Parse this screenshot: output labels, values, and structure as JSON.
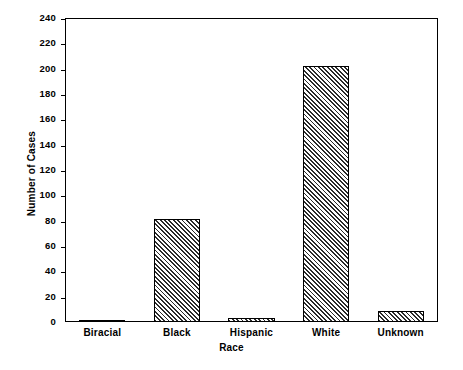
{
  "chart_data": {
    "type": "bar",
    "title": "",
    "subtitle": "",
    "xlabel": "Race",
    "ylabel": "Number of Cases",
    "categories": [
      "Biracial",
      "Black",
      "Hispanic",
      "White",
      "Unknown"
    ],
    "values": [
      1,
      81,
      3,
      202,
      9
    ],
    "series": [
      {
        "name": "Number of Cases",
        "values": [
          1,
          81,
          3,
          202,
          9
        ]
      }
    ],
    "ylim": [
      0,
      240
    ],
    "ytick_step": 20,
    "yticks": [
      0,
      20,
      40,
      60,
      80,
      100,
      120,
      140,
      160,
      180,
      200,
      220,
      240
    ],
    "ytick_labels": [
      "0",
      "20",
      "40",
      "60",
      "80",
      "100",
      "120",
      "140",
      "160",
      "180",
      "200",
      "220",
      "240"
    ],
    "grid": false,
    "legend": false,
    "legend_position": "none",
    "bar_fill": "diagonal-hatch",
    "bar_edge_color": "#000000",
    "axis_color": "#000000",
    "background_color": "#ffffff",
    "plot_border": "full-box"
  }
}
